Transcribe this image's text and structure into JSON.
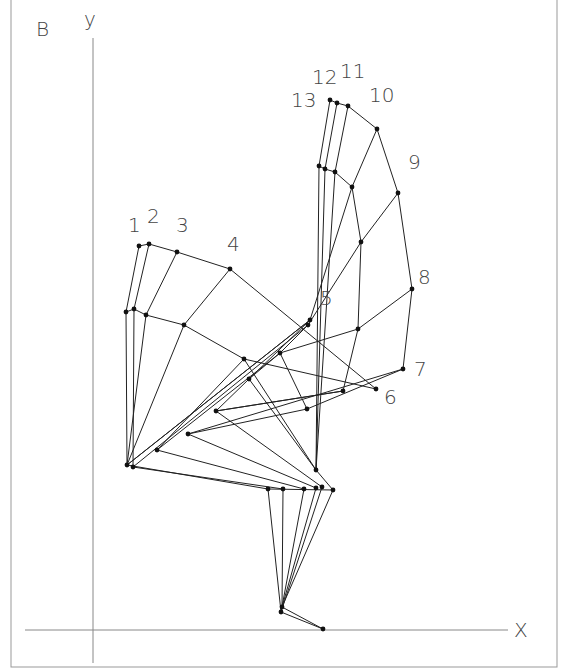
{
  "figure": {
    "panel_label": "B",
    "x_axis_label": "X",
    "y_axis_label": "y",
    "line_color": "#222222",
    "point_color": "#111111",
    "axis_color": "#888888"
  },
  "pose_labels": [
    {
      "text": "1",
      "x": 128,
      "y": 232
    },
    {
      "text": "2",
      "x": 147,
      "y": 223
    },
    {
      "text": "3",
      "x": 176,
      "y": 232
    },
    {
      "text": "4",
      "x": 227,
      "y": 251
    },
    {
      "text": "5",
      "x": 320,
      "y": 305
    },
    {
      "text": "6",
      "x": 384,
      "y": 404
    },
    {
      "text": "7",
      "x": 414,
      "y": 376
    },
    {
      "text": "8",
      "x": 418,
      "y": 284
    },
    {
      "text": "9",
      "x": 408,
      "y": 169
    },
    {
      "text": "10",
      "x": 369,
      "y": 102
    },
    {
      "text": "11",
      "x": 340,
      "y": 78
    },
    {
      "text": "12",
      "x": 312,
      "y": 84
    },
    {
      "text": "13",
      "x": 291,
      "y": 107
    }
  ],
  "points": [
    [
      139,
      246
    ],
    [
      149,
      244
    ],
    [
      177,
      252
    ],
    [
      230,
      269
    ],
    [
      126,
      312
    ],
    [
      134,
      309
    ],
    [
      146,
      315
    ],
    [
      184,
      325
    ],
    [
      319,
      166
    ],
    [
      325,
      169
    ],
    [
      335,
      172
    ],
    [
      352,
      187
    ],
    [
      398,
      193
    ],
    [
      361,
      242
    ],
    [
      330,
      100
    ],
    [
      337,
      103
    ],
    [
      348,
      106
    ],
    [
      377,
      129
    ],
    [
      412,
      289
    ],
    [
      310,
      320
    ],
    [
      308,
      325
    ],
    [
      358,
      329
    ],
    [
      244,
      359
    ],
    [
      280,
      353
    ],
    [
      403,
      369
    ],
    [
      249,
      379
    ],
    [
      343,
      391
    ],
    [
      376,
      389
    ],
    [
      307,
      409
    ],
    [
      127,
      465
    ],
    [
      133,
      467
    ],
    [
      157,
      450
    ],
    [
      188,
      434
    ],
    [
      216,
      411
    ],
    [
      316,
      470
    ],
    [
      268,
      489
    ],
    [
      283,
      489
    ],
    [
      304,
      489
    ],
    [
      316,
      488
    ],
    [
      322,
      487
    ],
    [
      333,
      490
    ],
    [
      281,
      612
    ],
    [
      282,
      607
    ],
    [
      323,
      629
    ]
  ],
  "segments": [
    [
      [
        139,
        246
      ],
      [
        149,
        244
      ],
      [
        177,
        252
      ],
      [
        230,
        269
      ],
      [
        376,
        389
      ]
    ],
    [
      [
        126,
        312
      ],
      [
        134,
        309
      ],
      [
        146,
        315
      ],
      [
        184,
        325
      ],
      [
        244,
        359
      ],
      [
        316,
        470
      ]
    ],
    [
      [
        139,
        246
      ],
      [
        126,
        312
      ],
      [
        127,
        465
      ]
    ],
    [
      [
        149,
        244
      ],
      [
        134,
        309
      ],
      [
        133,
        467
      ]
    ],
    [
      [
        177,
        252
      ],
      [
        146,
        315
      ],
      [
        127,
        465
      ]
    ],
    [
      [
        230,
        269
      ],
      [
        184,
        325
      ],
      [
        127,
        465
      ]
    ],
    [
      [
        330,
        100
      ],
      [
        337,
        103
      ],
      [
        348,
        106
      ],
      [
        377,
        129
      ],
      [
        398,
        193
      ],
      [
        412,
        289
      ],
      [
        403,
        369
      ]
    ],
    [
      [
        319,
        166
      ],
      [
        325,
        169
      ],
      [
        335,
        172
      ],
      [
        352,
        187
      ],
      [
        361,
        242
      ],
      [
        358,
        329
      ],
      [
        343,
        391
      ]
    ],
    [
      [
        330,
        100
      ],
      [
        319,
        166
      ],
      [
        316,
        470
      ]
    ],
    [
      [
        337,
        103
      ],
      [
        325,
        169
      ],
      [
        316,
        470
      ]
    ],
    [
      [
        348,
        106
      ],
      [
        335,
        172
      ],
      [
        316,
        470
      ]
    ],
    [
      [
        377,
        129
      ],
      [
        352,
        187
      ],
      [
        310,
        320
      ],
      [
        127,
        465
      ]
    ],
    [
      [
        398,
        193
      ],
      [
        361,
        242
      ],
      [
        308,
        325
      ],
      [
        133,
        467
      ]
    ],
    [
      [
        412,
        289
      ],
      [
        358,
        329
      ],
      [
        280,
        353
      ],
      [
        157,
        450
      ]
    ],
    [
      [
        403,
        369
      ],
      [
        307,
        409
      ],
      [
        188,
        434
      ]
    ],
    [
      [
        343,
        391
      ],
      [
        216,
        411
      ]
    ],
    [
      [
        376,
        389
      ],
      [
        244,
        359
      ]
    ],
    [
      [
        310,
        320
      ],
      [
        249,
        379
      ],
      [
        216,
        411
      ]
    ],
    [
      [
        308,
        325
      ],
      [
        280,
        353
      ],
      [
        249,
        379
      ],
      [
        316,
        470
      ]
    ],
    [
      [
        280,
        353
      ],
      [
        307,
        409
      ]
    ],
    [
      [
        127,
        465
      ],
      [
        268,
        489
      ],
      [
        281,
        612
      ]
    ],
    [
      [
        133,
        467
      ],
      [
        283,
        489
      ],
      [
        282,
        607
      ]
    ],
    [
      [
        157,
        450
      ],
      [
        304,
        489
      ],
      [
        281,
        612
      ]
    ],
    [
      [
        188,
        434
      ],
      [
        316,
        488
      ],
      [
        282,
        607
      ]
    ],
    [
      [
        216,
        411
      ],
      [
        322,
        487
      ],
      [
        281,
        612
      ]
    ],
    [
      [
        316,
        470
      ],
      [
        333,
        490
      ],
      [
        282,
        607
      ]
    ],
    [
      [
        268,
        489
      ],
      [
        333,
        490
      ]
    ],
    [
      [
        281,
        612
      ],
      [
        323,
        629
      ]
    ],
    [
      [
        282,
        607
      ],
      [
        323,
        629
      ]
    ],
    [
      [
        127,
        465
      ],
      [
        310,
        320
      ]
    ],
    [
      [
        157,
        450
      ],
      [
        244,
        359
      ]
    ],
    [
      [
        188,
        434
      ],
      [
        403,
        369
      ]
    ],
    [
      [
        216,
        411
      ],
      [
        343,
        391
      ]
    ]
  ]
}
